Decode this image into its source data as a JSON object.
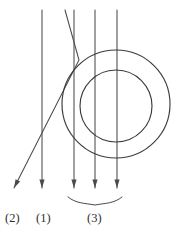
{
  "figure": {
    "background_color": "#ffffff",
    "stroke_color": "#4a4a4a",
    "circle_stroke_color": "#3c3c3c",
    "label_color": "#2e2e2e",
    "width": 176,
    "height": 235
  },
  "labels": [
    {
      "id": "label-2",
      "text": "(2)",
      "x": 5,
      "y": 222,
      "describes": "deflected ray"
    },
    {
      "id": "label-1",
      "text": "(1)",
      "x": 36,
      "y": 222,
      "describes": "undeviated ray"
    },
    {
      "id": "label-3",
      "text": "(3)",
      "x": 87,
      "y": 222,
      "describes": "ray bundle through lens"
    }
  ],
  "brace": {
    "id": "group-brace",
    "label_ref": "(3)",
    "left_x": 68,
    "right_x": 122,
    "top_y": 197,
    "tip_x": 95,
    "tip_y": 205,
    "covers_rays": [
      "ray-3",
      "ray-4",
      "ray-5"
    ]
  },
  "chart_data": {
    "type": "scatter",
    "xlabel": "",
    "ylabel": "",
    "xlim": [
      0,
      176
    ],
    "ylim": [
      235,
      0
    ],
    "grid": false,
    "legend": "none",
    "annotations": [
      "(2)",
      "(1)",
      "(3)"
    ],
    "circles": [
      {
        "name": "outer-circle",
        "cx": 116,
        "cy": 104,
        "r": 54
      },
      {
        "name": "inner-circle",
        "cx": 116,
        "cy": 106,
        "r": 36
      }
    ],
    "rays": [
      {
        "id": "ray-1",
        "label": "(1)",
        "kind": "straight",
        "x_top": 42,
        "y_top": 10,
        "x_end": 42,
        "y_end": 188,
        "arrow": true
      },
      {
        "id": "ray-2",
        "label": "(2)",
        "kind": "refracted",
        "x_top": 65,
        "y_top": 10,
        "x_bend": 79,
        "y_bend": 60,
        "x_end": 14,
        "y_end": 188,
        "arrow": true
      },
      {
        "id": "ray-3",
        "label": "(3)",
        "kind": "straight",
        "x_top": 74,
        "y_top": 10,
        "x_end": 74,
        "y_end": 188,
        "arrow": true
      },
      {
        "id": "ray-4",
        "label": "(3)",
        "kind": "straight",
        "x_top": 95,
        "y_top": 10,
        "x_end": 95,
        "y_end": 188,
        "arrow": true
      },
      {
        "id": "ray-5",
        "label": "(3)",
        "kind": "straight",
        "x_top": 117,
        "y_top": 10,
        "x_end": 117,
        "y_end": 188,
        "arrow": true
      }
    ]
  }
}
